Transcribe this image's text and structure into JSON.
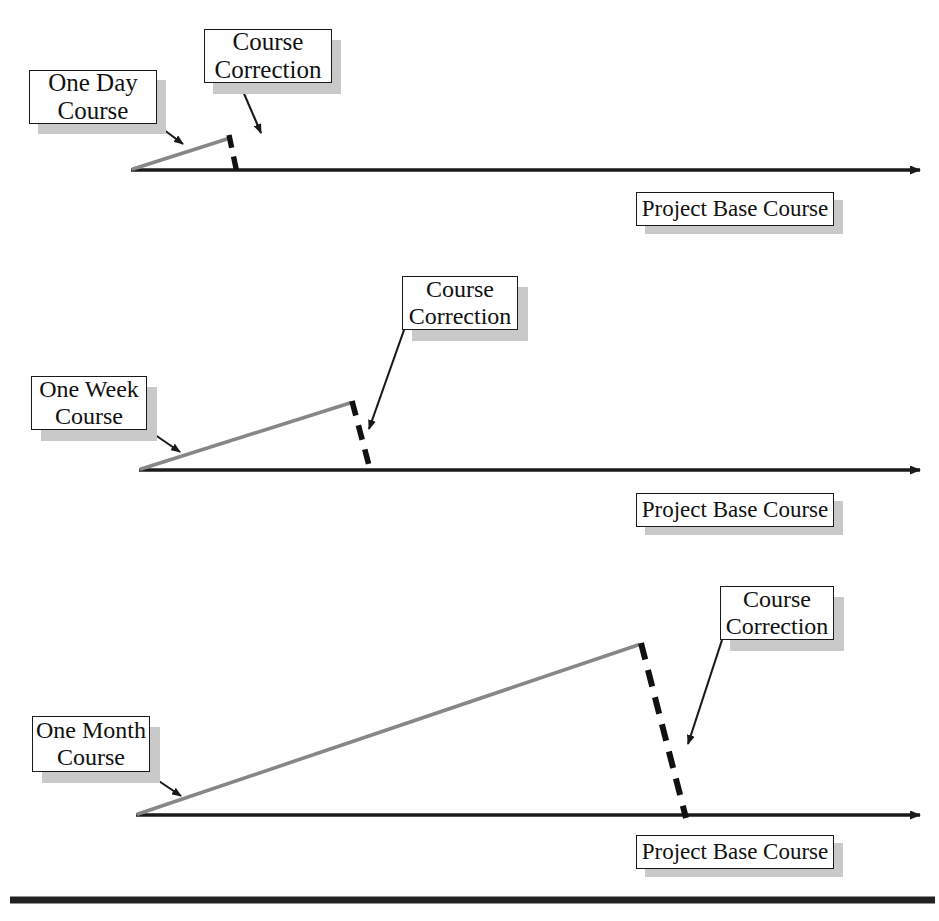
{
  "diagram": {
    "title_text": "",
    "colors": {
      "baseline": "#1a1a1a",
      "divergence": "#878787",
      "correction_dash": "#111111",
      "pointer": "#1a1a1a",
      "box_border": "#1a1a1a",
      "box_fill": "#ffffff",
      "box_shadow": "#c9c9c9",
      "page_background": "#ffffff",
      "rule": "#222222"
    },
    "panels": [
      {
        "id": "one-day",
        "course_label": {
          "line1": "One Day",
          "line2": "Course"
        },
        "correction_label": {
          "line1": "Course",
          "line2": "Correction"
        },
        "base_label": "Project Base Course",
        "baseline": {
          "x1": 131,
          "y": 170,
          "x2": 928
        },
        "divergence": {
          "x1": 133,
          "y1": 169,
          "x2": 227,
          "y2": 139
        },
        "correction": {
          "x1": 229,
          "y1": 136,
          "x2": 236,
          "y2": 172
        }
      },
      {
        "id": "one-week",
        "course_label": {
          "line1": "One Week",
          "line2": "Course"
        },
        "correction_label": {
          "line1": "Course",
          "line2": "Correction"
        },
        "base_label": "Project Base Course",
        "baseline": {
          "x1": 139,
          "y": 470,
          "x2": 928
        },
        "divergence": {
          "x1": 141,
          "y1": 469,
          "x2": 350,
          "y2": 403
        },
        "correction": {
          "x1": 352,
          "y1": 401,
          "x2": 370,
          "y2": 472
        }
      },
      {
        "id": "one-month",
        "course_label": {
          "line1": "One Month",
          "line2": "Course"
        },
        "correction_label": {
          "line1": "Course",
          "line2": "Correction"
        },
        "base_label": "Project Base Course",
        "baseline": {
          "x1": 136,
          "y": 815,
          "x2": 928
        },
        "divergence": {
          "x1": 138,
          "y1": 814,
          "x2": 638,
          "y2": 645
        },
        "correction": {
          "x1": 641,
          "y1": 643,
          "x2": 685,
          "y2": 817
        }
      }
    ],
    "footer_rule": {
      "x1": 10,
      "x2": 935,
      "y": 900
    }
  }
}
